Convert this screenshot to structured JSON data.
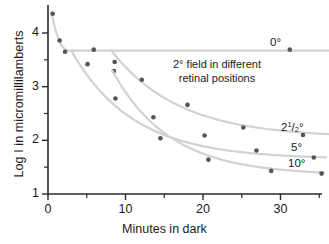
{
  "chart_data": {
    "type": "line",
    "title": "",
    "xlabel": "Minutes in dark",
    "ylabel": "Log I in micromillilamberts",
    "xlim": [
      0,
      36.5
    ],
    "ylim": [
      1,
      4.45
    ],
    "grid": false,
    "legend_position": "inline-right",
    "annotations": [
      {
        "text_line1": "2° field in different",
        "text_line2": "retinal positions",
        "x": 17,
        "y": 3.25
      }
    ],
    "xticks": [
      0,
      10,
      20,
      30
    ],
    "xticklabels": [
      "0",
      "10",
      "20",
      "30"
    ],
    "xminorticks": [
      5,
      15,
      25,
      35
    ],
    "yticks": [
      1,
      2,
      3,
      4
    ],
    "yticklabels": [
      "1",
      "2",
      "3",
      "4"
    ],
    "yminorticks": [
      1.5,
      2.5,
      3.5
    ],
    "series": [
      {
        "name": "0°",
        "label": "0°",
        "label_x": 31.5,
        "label_y": 3.82,
        "points": [
          {
            "x": 0.6,
            "y": 4.36
          },
          {
            "x": 1.5,
            "y": 3.86
          },
          {
            "x": 2.2,
            "y": 3.65
          },
          {
            "x": 5.9,
            "y": 3.69
          },
          {
            "x": 31.2,
            "y": 3.69
          }
        ],
        "asymptote": 3.67
      },
      {
        "name": "2½°",
        "label": "2¹/₂°",
        "label_x": 33.2,
        "label_y": 2.38,
        "points": [
          {
            "x": 8.6,
            "y": 3.46
          },
          {
            "x": 12.1,
            "y": 3.13
          },
          {
            "x": 18.0,
            "y": 2.66
          },
          {
            "x": 25.2,
            "y": 2.24
          },
          {
            "x": 32.9,
            "y": 2.1
          }
        ],
        "asymptote": 2.05
      },
      {
        "name": "5°",
        "label": "5°",
        "label_x": 34.2,
        "label_y": 1.95,
        "points": [
          {
            "x": 5.1,
            "y": 3.42
          },
          {
            "x": 8.5,
            "y": 3.29
          },
          {
            "x": 13.6,
            "y": 2.43
          },
          {
            "x": 20.2,
            "y": 2.09
          },
          {
            "x": 26.9,
            "y": 1.81
          },
          {
            "x": 34.3,
            "y": 1.68
          }
        ],
        "asymptote": 1.65
      },
      {
        "name": "10°",
        "label": "10°",
        "label_x": 34.0,
        "label_y": 1.72,
        "points": [
          {
            "x": 8.7,
            "y": 2.78
          },
          {
            "x": 14.5,
            "y": 2.04
          },
          {
            "x": 20.7,
            "y": 1.64
          },
          {
            "x": 28.8,
            "y": 1.43
          },
          {
            "x": 35.3,
            "y": 1.38
          }
        ],
        "asymptote": 1.35
      }
    ],
    "colors": {
      "curve": "#d2d2d2",
      "point": "#555555",
      "axis": "#2a2a2a",
      "text": "#1a1a1a"
    }
  }
}
